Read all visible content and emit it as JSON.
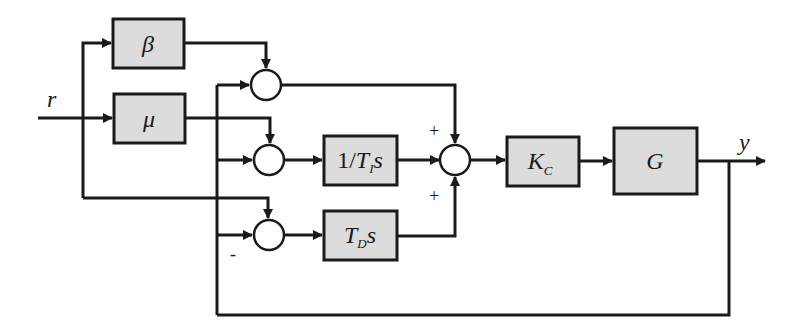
{
  "diagram": {
    "type": "block-diagram",
    "signals": {
      "input": "r",
      "output": "y"
    },
    "blocks": {
      "beta": {
        "label": "β"
      },
      "mu": {
        "label": "μ"
      },
      "integral": {
        "label_prefix": "1/",
        "label_main": "T",
        "label_sub": "I",
        "label_suffix": "s"
      },
      "derivative": {
        "label_main": "T",
        "label_sub": "D",
        "label_suffix": "s"
      },
      "gain": {
        "label_main": "K",
        "label_sub": "C"
      },
      "plant": {
        "label": "G"
      }
    },
    "signs": {
      "main_sum_top": "+",
      "main_sum_bottom": "+",
      "derivative_sum_minus": "-"
    },
    "colors": {
      "block_fill": "#dcdcdc",
      "line": "#1a1a1a",
      "background": "#ffffff"
    }
  }
}
